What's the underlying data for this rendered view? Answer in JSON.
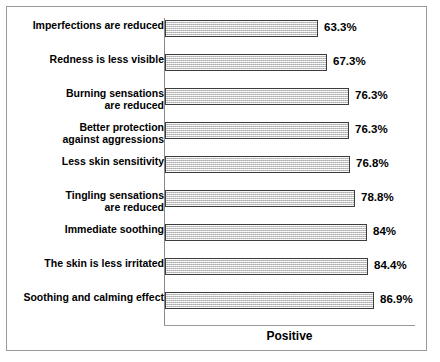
{
  "chart_data": {
    "type": "bar",
    "orientation": "horizontal",
    "title": "",
    "xlabel": "Positive",
    "ylabel": "",
    "grid": false,
    "legend": false,
    "xlim": [
      0,
      100
    ],
    "categories": [
      "Imperfections are reduced",
      "Redness is less visible",
      "Burning sensations\nare reduced",
      "Better protection\nagainst aggressions",
      "Less skin sensitivity",
      "Tingling sensations\nare reduced",
      "Immediate soothing",
      "The skin is less irritated",
      "Soothing and calming effect"
    ],
    "values": [
      63.3,
      67.3,
      76.3,
      76.3,
      76.8,
      78.8,
      84,
      84.4,
      86.9
    ],
    "value_labels": [
      "63.3%",
      "67.3%",
      "76.3%",
      "76.3%",
      "76.8%",
      "78.8%",
      "84%",
      "84.4%",
      "86.9%"
    ],
    "bar_fill_color": "#d6d6d6",
    "bar_border_color": "#3c3c3c",
    "axis_color": "#8a8a8a",
    "frame_color": "#9a9a9a",
    "text_color": "#000000"
  },
  "axis": {
    "value_axis_title": "Positive"
  }
}
